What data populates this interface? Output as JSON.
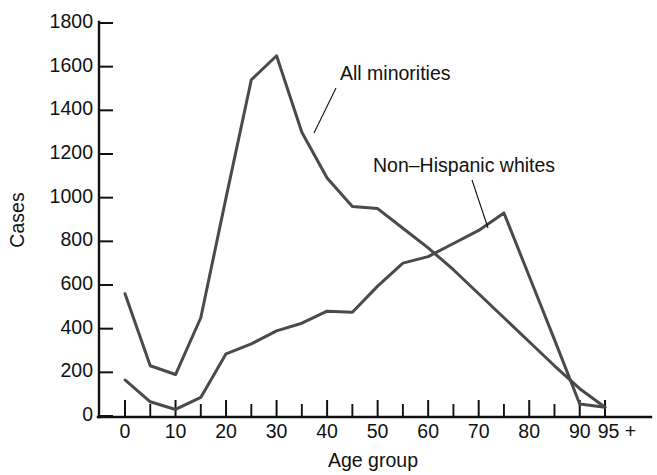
{
  "chart_data": {
    "type": "line",
    "title": "",
    "xlabel": "Age group",
    "ylabel": "Cases",
    "xlim": [
      0,
      95
    ],
    "ylim": [
      0,
      1800
    ],
    "grid": false,
    "legend_position": "inline-annotations",
    "x": [
      0,
      5,
      10,
      15,
      20,
      25,
      30,
      35,
      40,
      45,
      50,
      55,
      60,
      65,
      70,
      75,
      80,
      85,
      90,
      95
    ],
    "xtick_labels": [
      "0",
      "10",
      "20",
      "30",
      "40",
      "50",
      "60",
      "70",
      "80",
      "90",
      "95 +"
    ],
    "xtick_values": [
      0,
      10,
      20,
      30,
      40,
      50,
      60,
      70,
      80,
      90,
      95
    ],
    "ytick_labels": [
      "0",
      "200",
      "400",
      "600",
      "800",
      "1000",
      "1200",
      "1400",
      "1600",
      "1800"
    ],
    "ytick_values": [
      0,
      200,
      400,
      600,
      800,
      1000,
      1200,
      1400,
      1600,
      1800
    ],
    "series": [
      {
        "name": "All minorities",
        "color": "#4a4a4a",
        "values": [
          560,
          230,
          190,
          450,
          1000,
          1540,
          1650,
          1300,
          1090,
          960,
          950,
          860,
          770,
          670,
          560,
          450,
          340,
          230,
          125,
          40
        ]
      },
      {
        "name": "Non–Hispanic whites",
        "color": "#4a4a4a",
        "values": [
          165,
          65,
          30,
          85,
          285,
          330,
          390,
          425,
          480,
          475,
          595,
          700,
          730,
          790,
          850,
          930,
          640,
          350,
          55,
          40
        ]
      }
    ],
    "annotations": [
      {
        "text": "All minorities",
        "label_x": 340,
        "label_y": 80,
        "leader_from_x": 336,
        "leader_from_y": 88,
        "leader_to_x": 314,
        "leader_to_y": 133
      },
      {
        "text": "Non–Hispanic whites",
        "label_x": 373,
        "label_y": 172,
        "leader_from_x": 472,
        "leader_from_y": 180,
        "leader_to_x": 488,
        "leader_to_y": 228
      }
    ]
  },
  "figure": {
    "y_axis_title": "Cases",
    "x_axis_title": "Age group"
  }
}
